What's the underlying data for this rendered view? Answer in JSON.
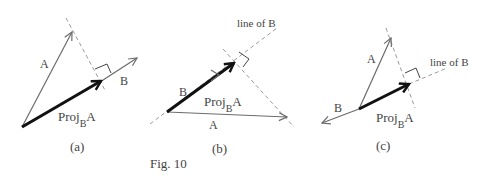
{
  "figure": {
    "caption": "Fig. 10",
    "colors": {
      "vector": "#6b6b6b",
      "projection": "#111111",
      "dashed": "#9a9a9a",
      "text": "#444444"
    },
    "panels": [
      {
        "id": "a",
        "label": "(a)",
        "vector_a_label": "A",
        "vector_b_label": "B",
        "projection_label_main": "Proj",
        "projection_label_sub": "B",
        "projection_label_tail": "A"
      },
      {
        "id": "b",
        "label": "(b)",
        "vector_a_label": "A",
        "vector_b_label": "B",
        "projection_label_main": "Proj",
        "projection_label_sub": "B",
        "projection_label_tail": "A",
        "line_label": "line of B"
      },
      {
        "id": "c",
        "label": "(c)",
        "vector_a_label": "A",
        "vector_b_label": "B",
        "projection_label_main": "Proj",
        "projection_label_sub": "B",
        "projection_label_tail": "A",
        "line_label": "line of B"
      }
    ]
  }
}
